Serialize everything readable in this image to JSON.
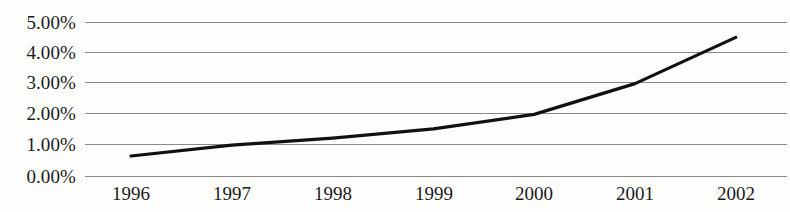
{
  "chart_data": {
    "type": "line",
    "title": "",
    "subtitle": "",
    "xlabel": "",
    "ylabel": "",
    "categories": [
      "1996",
      "1997",
      "1998",
      "1999",
      "2000",
      "2001",
      "2002"
    ],
    "values": [
      0.65,
      1.0,
      1.23,
      1.53,
      2.0,
      3.0,
      4.5
    ],
    "series": [
      {
        "name": "",
        "values": [
          0.65,
          1.0,
          1.23,
          1.53,
          2.0,
          3.0,
          4.5
        ]
      }
    ],
    "y_tick_labels": [
      "0.00%",
      "1.00%",
      "2.00%",
      "3.00%",
      "4.00%",
      "5.00%"
    ],
    "y_tick_values": [
      0,
      1,
      2,
      3,
      4,
      5
    ],
    "x_tick_labels": [
      "1996",
      "1997",
      "1998",
      "1999",
      "2000",
      "2001",
      "2002"
    ],
    "ylim": [
      0,
      5
    ],
    "value_unit": "%",
    "grid": true,
    "grid_axis": "y",
    "legend": false,
    "legend_position": "none",
    "markers": false,
    "annotations": [],
    "colors": {
      "line": "#111111",
      "gridline": "#8a8a8a",
      "background": "#fdfdfc",
      "text": "#1a1a1a"
    }
  }
}
